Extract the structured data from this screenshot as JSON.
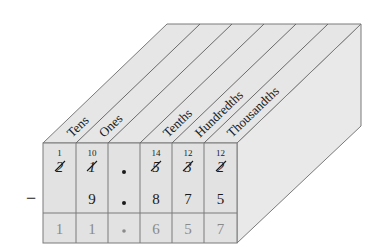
{
  "diagram": {
    "operation_symbol": "−",
    "columns": [
      {
        "label": "Tens",
        "regroup": "1",
        "minuend": "2",
        "crossed": true,
        "subtrahend": "",
        "difference": "1"
      },
      {
        "label": "Ones",
        "regroup": "10",
        "minuend": "1",
        "crossed": true,
        "subtrahend": "9",
        "difference": "1"
      },
      {
        "label": "",
        "regroup": "",
        "minuend": "•",
        "crossed": false,
        "subtrahend": "•",
        "difference": "•"
      },
      {
        "label": "Tenths",
        "regroup": "14",
        "minuend": "5",
        "crossed": true,
        "subtrahend": "8",
        "difference": "6"
      },
      {
        "label": "Hundredths",
        "regroup": "12",
        "minuend": "3",
        "crossed": true,
        "subtrahend": "7",
        "difference": "5"
      },
      {
        "label": "Thousandths",
        "regroup": "12",
        "minuend": "2",
        "crossed": true,
        "subtrahend": "5",
        "difference": "7"
      }
    ],
    "colors": {
      "front_face": "#e2e2e2",
      "top_face": "#e6e6e6",
      "side_face": "#e9e9e9",
      "line": "#7a7a7a",
      "text": "#1a1a1a",
      "answer_text": "#8a8a8a"
    }
  }
}
